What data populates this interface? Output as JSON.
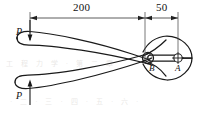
{
  "figure": {
    "stroke_color": "#1a1a1a",
    "background_color": "#ffffff",
    "dimensions": [
      {
        "label": "200",
        "from_x": 30,
        "to_x": 145,
        "y": 18,
        "units": "mm"
      },
      {
        "label": "50",
        "from_x": 145,
        "to_x": 178,
        "y": 18,
        "units": "mm"
      }
    ],
    "forces": [
      {
        "label": "P",
        "position": "upper-handle-left",
        "direction": "down",
        "x": 23,
        "y": 30
      },
      {
        "label": "P",
        "position": "lower-handle-left",
        "direction": "up",
        "x": 23,
        "y": 94
      }
    ],
    "points": [
      {
        "label": "B",
        "role": "pivot-pin",
        "x": 148,
        "y": 58,
        "hatched": true
      },
      {
        "label": "A",
        "role": "gripped-workpiece",
        "x": 178,
        "y": 58,
        "hatched": false
      }
    ]
  },
  "background_text": {
    "line1": "工 程 力 学  ·  第 二 章",
    "line2": "· 二 · 三 · 四 · 五 · 六 ·"
  }
}
